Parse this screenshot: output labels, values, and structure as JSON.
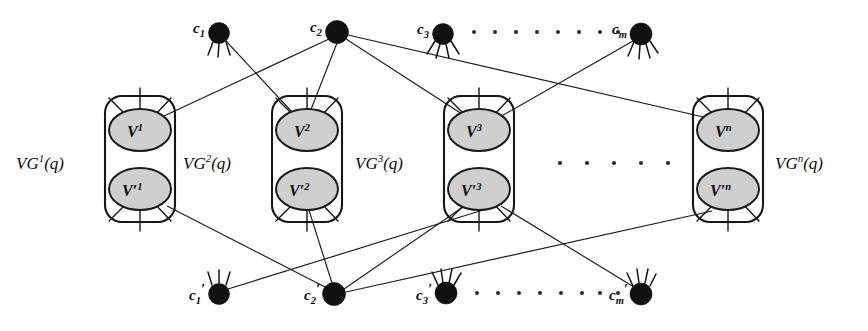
{
  "figure": {
    "background_color": "#ffffff",
    "line_color": "#1b1b1b",
    "node_fill": "#111111",
    "ellipse_fill": "#cfcfcf",
    "ellipse_stroke": "#1a1a1a",
    "width": 868,
    "height": 331
  },
  "top_clauses": [
    {
      "id": "c1",
      "base": "c",
      "sub": "1",
      "x": 219,
      "y": 33,
      "r": 10.5,
      "label_x": 196,
      "label_y": 29
    },
    {
      "id": "c2",
      "base": "c",
      "sub": "2",
      "x": 337,
      "y": 32,
      "r": 11.5,
      "label_x": 313,
      "label_y": 28
    },
    {
      "id": "c3",
      "base": "c",
      "sub": "3",
      "x": 443,
      "y": 34,
      "r": 10.5,
      "label_x": 420,
      "label_y": 30
    },
    {
      "id": "cm",
      "base": "c",
      "sub": "m",
      "x": 641,
      "y": 34,
      "r": 11.0,
      "label_x": 615,
      "label_y": 30
    }
  ],
  "bottom_clauses": [
    {
      "id": "c1p",
      "base": "c",
      "prime": "′",
      "sub": "1",
      "x": 219,
      "y": 294,
      "r": 10.5,
      "label_x": 192,
      "label_y": 303
    },
    {
      "id": "c2p",
      "base": "c",
      "prime": "′",
      "sub": "2",
      "x": 334,
      "y": 294,
      "r": 11.5,
      "label_x": 307,
      "label_y": 303
    },
    {
      "id": "c3p",
      "base": "c",
      "prime": "′",
      "sub": "3",
      "x": 446,
      "y": 293,
      "r": 11.0,
      "label_x": 419,
      "label_y": 302
    },
    {
      "id": "cmp",
      "base": "c",
      "prime": "′",
      "sub": "m",
      "x": 641,
      "y": 294,
      "r": 11.0,
      "label_x": 612,
      "label_y": 303
    }
  ],
  "gadgets": [
    {
      "id": "VG1",
      "box": {
        "x": 105,
        "y": 96,
        "w": 70,
        "h": 126,
        "rx": 17
      },
      "top_var": {
        "text": "V",
        "sup": "1",
        "cx": 140,
        "cy": 130,
        "rx": 31,
        "ry": 21
      },
      "bottom_var": {
        "text": "V′",
        "sup": "1",
        "cx": 140,
        "cy": 189,
        "rx": 31,
        "ry": 21
      },
      "label": {
        "text": "VG",
        "sup": "1",
        "suffix": "(q)",
        "x": 16,
        "y": 163
      }
    },
    {
      "id": "VG2",
      "box": {
        "x": 272,
        "y": 96,
        "w": 70,
        "h": 126,
        "rx": 17
      },
      "top_var": {
        "text": "V",
        "sup": "2",
        "cx": 307,
        "cy": 130,
        "rx": 31,
        "ry": 21
      },
      "bottom_var": {
        "text": "V′",
        "sup": "2",
        "cx": 307,
        "cy": 189,
        "rx": 31,
        "ry": 21
      },
      "label": {
        "text": "VG",
        "sup": "2",
        "suffix": "(q)",
        "x": 183,
        "y": 163
      }
    },
    {
      "id": "VG3",
      "box": {
        "x": 444,
        "y": 96,
        "w": 70,
        "h": 126,
        "rx": 17
      },
      "top_var": {
        "text": "V",
        "sup": "3",
        "cx": 479,
        "cy": 130,
        "rx": 31,
        "ry": 21
      },
      "bottom_var": {
        "text": "V′",
        "sup": "3",
        "cx": 479,
        "cy": 189,
        "rx": 31,
        "ry": 21
      },
      "label": {
        "text": "VG",
        "sup": "3",
        "suffix": "(q)",
        "x": 355,
        "y": 163
      }
    },
    {
      "id": "VGn",
      "box": {
        "x": 693,
        "y": 96,
        "w": 70,
        "h": 126,
        "rx": 17
      },
      "top_var": {
        "text": "V",
        "sup": "n",
        "cx": 728,
        "cy": 130,
        "rx": 31,
        "ry": 21
      },
      "bottom_var": {
        "text": "V′",
        "sup": "n",
        "cx": 728,
        "cy": 189,
        "rx": 31,
        "ry": 21
      },
      "label": {
        "text": "VG",
        "sup": "n",
        "suffix": "(q)",
        "x": 775,
        "y": 163
      }
    }
  ],
  "edges_top": [
    {
      "from": "c1",
      "to": "V2",
      "x1": 226,
      "y1": 41,
      "x2": 292,
      "y2": 112
    },
    {
      "from": "c2",
      "to": "V1",
      "x1": 329,
      "y1": 39,
      "x2": 164,
      "y2": 116
    },
    {
      "from": "c2",
      "to": "V2",
      "x1": 337,
      "y1": 43,
      "x2": 310,
      "y2": 112
    },
    {
      "from": "c2",
      "to": "V3",
      "x1": 346,
      "y1": 39,
      "x2": 462,
      "y2": 114
    },
    {
      "from": "c2",
      "to": "Vn",
      "x1": 348,
      "y1": 35,
      "x2": 712,
      "y2": 118
    },
    {
      "from": "cm",
      "to": "V3",
      "x1": 633,
      "y1": 41,
      "x2": 498,
      "y2": 118
    }
  ],
  "edges_bottom": [
    {
      "from": "c1p",
      "to": "V3p",
      "x1": 228,
      "y1": 289,
      "x2": 495,
      "y2": 206
    },
    {
      "from": "c2p",
      "to": "V1p",
      "x1": 327,
      "y1": 288,
      "x2": 168,
      "y2": 206
    },
    {
      "from": "c2p",
      "to": "V2p",
      "x1": 332,
      "y1": 283,
      "x2": 308,
      "y2": 207
    },
    {
      "from": "c2p",
      "to": "V3p",
      "x1": 344,
      "y1": 289,
      "x2": 463,
      "y2": 207
    },
    {
      "from": "c2p",
      "to": "Vnp",
      "x1": 346,
      "y1": 292,
      "x2": 712,
      "y2": 210
    },
    {
      "from": "cmp",
      "to": "V3p",
      "x1": 634,
      "y1": 287,
      "x2": 500,
      "y2": 206
    }
  ],
  "top_ellipsis": {
    "y": 32,
    "count": 8,
    "x_start": 470,
    "x_step": 21
  },
  "bottom_ellipsis": {
    "y": 293,
    "count": 8,
    "x_start": 474,
    "x_step": 21
  },
  "middle_ellipsis": {
    "y": 163,
    "count": 5,
    "x_start": 560,
    "x_step": 27
  },
  "node_spikes": {
    "c1": [
      [
        -0.42,
        "up"
      ],
      [
        -0.1,
        "up"
      ],
      [
        0.2,
        "up"
      ]
    ],
    "description": "short radial whisker strokes around clause dots"
  }
}
